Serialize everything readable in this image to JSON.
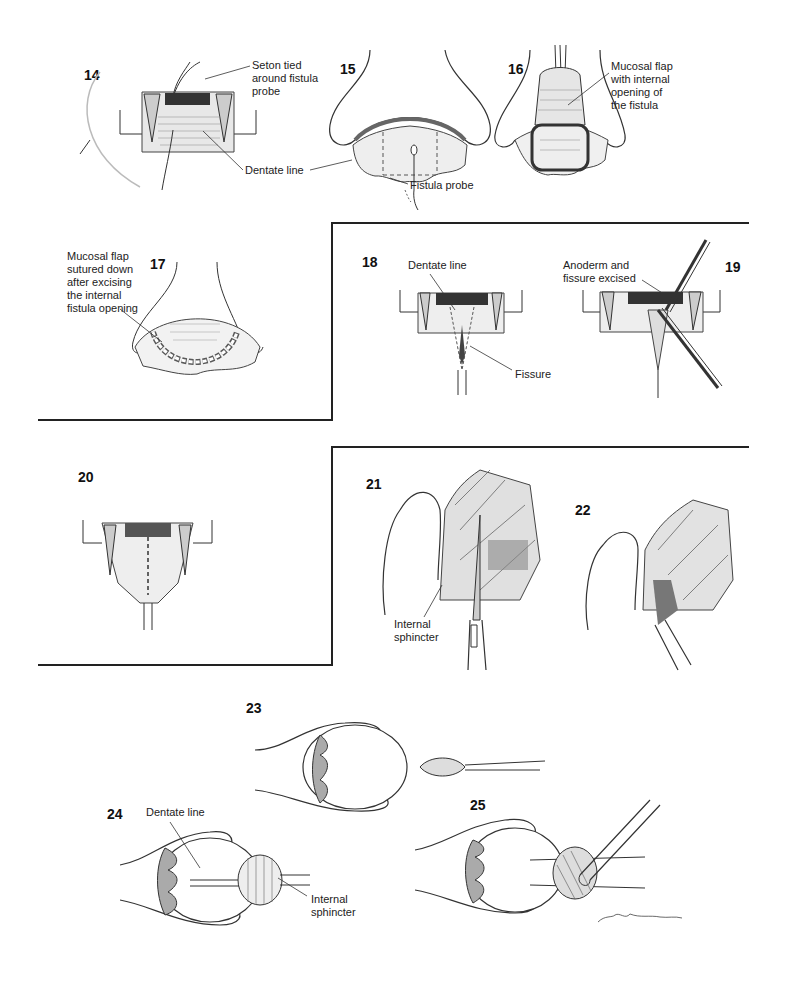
{
  "figures": [
    {
      "number": "14",
      "labels": [
        "Seton tied\naround fistula\nprobe",
        "Dentate line"
      ]
    },
    {
      "number": "15",
      "labels": [
        "Fistula probe"
      ]
    },
    {
      "number": "16",
      "labels": [
        "Mucosal flap\nwith internal\nopening of\nthe fistula"
      ]
    },
    {
      "number": "17",
      "labels": [
        "Mucosal flap\nsutured down\nafter excising\nthe internal\nfistula opening"
      ]
    },
    {
      "number": "18",
      "labels": [
        "Dentate line",
        "Fissure"
      ]
    },
    {
      "number": "19",
      "labels": [
        "Anoderm and\nfissure excised"
      ]
    },
    {
      "number": "20",
      "labels": []
    },
    {
      "number": "21",
      "labels": [
        "Internal\nsphincter"
      ]
    },
    {
      "number": "22",
      "labels": []
    },
    {
      "number": "23",
      "labels": []
    },
    {
      "number": "24",
      "labels": [
        "Dentate line",
        "Internal\nsphincter"
      ]
    },
    {
      "number": "25",
      "labels": []
    }
  ]
}
